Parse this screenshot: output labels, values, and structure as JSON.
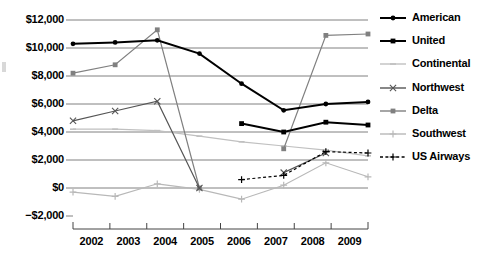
{
  "chart_data": {
    "type": "line",
    "title": "",
    "subtitle": "",
    "xlabel": "",
    "ylabel": "",
    "categories": [
      "2002",
      "2003",
      "2004",
      "2005",
      "2006",
      "2007",
      "2008",
      "2009"
    ],
    "x": [
      2002,
      2003,
      2004,
      2005,
      2006,
      2007,
      2008,
      2009
    ],
    "ylim": [
      -2000,
      12000
    ],
    "ytick_values": [
      12000,
      10000,
      8000,
      6000,
      4000,
      2000,
      0,
      -2000
    ],
    "ytick_labels": [
      "$12,000",
      "$10,000",
      "$8,000",
      "$6,000",
      "$4,000",
      "$2,000",
      "$0",
      "−$2,000"
    ],
    "grid": true,
    "legend_position": "right",
    "series": [
      {
        "name": "American",
        "color": "#000000",
        "marker": "circle",
        "line_style": "solid",
        "line_width": 2,
        "values": [
          10300,
          10400,
          10550,
          null,
          null,
          null,
          null,
          null
        ]
      },
      {
        "name": "United",
        "color": "#000000",
        "marker": "square",
        "line_style": "solid",
        "line_width": 2,
        "values": [
          null,
          null,
          null,
          null,
          4600,
          4000,
          4700,
          4500
        ]
      },
      {
        "name": "Continental",
        "color": "#c0c0c0",
        "marker": "dash",
        "line_style": "solid",
        "line_width": 1.2,
        "values": [
          4200,
          4200,
          4100,
          3700,
          3300,
          3000,
          2700,
          2300
        ]
      },
      {
        "name": "Northwest",
        "color": "#555555",
        "marker": "x",
        "line_style": "solid",
        "line_width": 1.2,
        "values": [
          4800,
          5500,
          6200,
          0,
          null,
          1100,
          2500,
          null
        ]
      },
      {
        "name": "Delta",
        "color": "#808080",
        "marker": "square",
        "line_style": "solid",
        "line_width": 1.2,
        "values": [
          8200,
          8800,
          11300,
          0,
          null,
          2800,
          10900,
          11000
        ]
      },
      {
        "name": "Southwest",
        "color": "#b8b8b8",
        "marker": "plus",
        "line_style": "solid",
        "line_width": 1.2,
        "values": [
          -300,
          -600,
          300,
          -100,
          -800,
          200,
          1800,
          800
        ]
      },
      {
        "name": "US Airways",
        "color": "#000000",
        "marker": "plus",
        "line_style": "dashed",
        "line_width": 1.2,
        "values": [
          null,
          null,
          null,
          null,
          600,
          900,
          2600,
          2500
        ]
      }
    ],
    "american_full": [
      10300,
      10400,
      10550,
      9600,
      7450,
      5550,
      6000,
      6150
    ],
    "united_full": [
      null,
      null,
      null,
      null,
      4600,
      4000,
      4700,
      4500
    ]
  },
  "axes": {
    "y_labels": [
      {
        "text": "$12,000",
        "value": 12000
      },
      {
        "text": "$10,000",
        "value": 10000
      },
      {
        "text": "$8,000",
        "value": 8000
      },
      {
        "text": "$6,000",
        "value": 6000
      },
      {
        "text": "$4,000",
        "value": 4000
      },
      {
        "text": "$2,000",
        "value": 2000
      },
      {
        "text": "$0",
        "value": 0
      },
      {
        "text": "−$2,000",
        "value": -2000
      }
    ],
    "x_labels": [
      "2002",
      "2003",
      "2004",
      "2005",
      "2006",
      "2007",
      "2008",
      "2009"
    ]
  },
  "legend": {
    "items": [
      {
        "label": "American",
        "color": "#000000",
        "marker": "circle",
        "style": "solid",
        "width": 2
      },
      {
        "label": "United",
        "color": "#000000",
        "marker": "square",
        "style": "solid",
        "width": 2
      },
      {
        "label": "Continental",
        "color": "#c0c0c0",
        "marker": "dash",
        "style": "solid",
        "width": 1.4
      },
      {
        "label": "Northwest",
        "color": "#555555",
        "marker": "x",
        "style": "solid",
        "width": 1.4
      },
      {
        "label": "Delta",
        "color": "#808080",
        "marker": "square",
        "style": "solid",
        "width": 1.4
      },
      {
        "label": "Southwest",
        "color": "#b8b8b8",
        "marker": "plus",
        "style": "solid",
        "width": 1.4
      },
      {
        "label": "US Airways",
        "color": "#000000",
        "marker": "plus",
        "style": "dashed",
        "width": 1.4
      }
    ]
  }
}
